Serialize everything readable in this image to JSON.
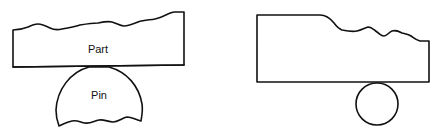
{
  "diagrams": [
    {
      "id": "left",
      "part_label": "Part",
      "pin_label": "Pin",
      "description": "Part with rough top surface resting on a truncated (D-shaped) pin with rough bottom"
    },
    {
      "id": "right",
      "description": "Part with flat-then-rough top surface resting on a full circular pin"
    }
  ],
  "colors": {
    "stroke": "#111111",
    "background": "#ffffff"
  }
}
